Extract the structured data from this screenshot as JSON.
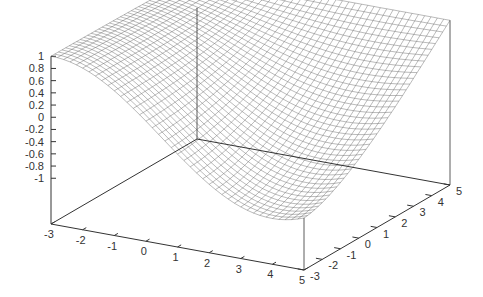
{
  "chart_data": {
    "type": "surface3d",
    "title": "",
    "xlabel": "",
    "ylabel": "",
    "zlabel": "",
    "x_range": [
      -3,
      5
    ],
    "y_range": [
      -3,
      5
    ],
    "z_range": [
      -1,
      1
    ],
    "x_ticks": [
      "-3",
      "-2",
      "-1",
      "0",
      "1",
      "2",
      "3",
      "4",
      "5"
    ],
    "y_ticks": [
      "-3",
      "-2",
      "-1",
      "0",
      "1",
      "2",
      "3",
      "4",
      "5"
    ],
    "z_ticks": [
      "1",
      "0.8",
      "0.6",
      "0.4",
      "0.2",
      "0",
      "-0.2",
      "-0.4",
      "-0.6",
      "-0.8",
      "-1"
    ],
    "grid_resolution": [
      40,
      40
    ],
    "style": "wireframe mesh, hidden-line",
    "corner_values": {
      "x=-3,y=-3": 1.0,
      "x=5,y=-3": -0.75,
      "x=5,y=5": 0.95,
      "x=-3,y=5": 1.0
    },
    "minimum_approx": -1.0,
    "colors": {
      "mesh": "#555555",
      "axes": "#333333",
      "background": "#ffffff"
    }
  }
}
